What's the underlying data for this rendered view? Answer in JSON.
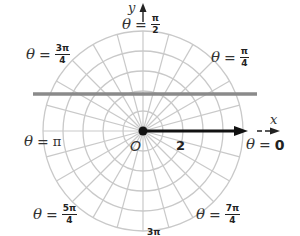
{
  "diagram": {
    "type": "polar-grid",
    "center": {
      "x": 143,
      "y": 131
    },
    "rings": {
      "count": 5,
      "spacing_px": 20
    },
    "ray_step_degrees": 15,
    "colors": {
      "grid": "#c9c9c9",
      "horizontal_line": "#8a8a8a",
      "vector": "#111111",
      "text": "#333333"
    },
    "axes": {
      "x_label": "x",
      "y_label": "y"
    },
    "origin_label": "O",
    "vector": {
      "length_label": "2",
      "direction": "θ = 0"
    },
    "horizontal_line": {
      "x1": 33,
      "x2": 257,
      "y": 94
    },
    "angle_labels": [
      {
        "id": "theta-0",
        "theta": "θ",
        "eq": "=",
        "value": "0"
      },
      {
        "id": "theta-pi-4",
        "theta": "θ",
        "eq": "=",
        "num": "π",
        "den": "4"
      },
      {
        "id": "theta-pi-2",
        "theta": "θ",
        "eq": "=",
        "num": "π",
        "den": "2"
      },
      {
        "id": "theta-3pi-4",
        "theta": "θ",
        "eq": "=",
        "num": "3π",
        "den": "4"
      },
      {
        "id": "theta-pi",
        "theta": "θ",
        "eq": "=",
        "value": "π"
      },
      {
        "id": "theta-5pi-4",
        "theta": "θ",
        "eq": "=",
        "num": "5π",
        "den": "4"
      },
      {
        "id": "theta-3pi-2-partial",
        "num": "3π"
      },
      {
        "id": "theta-7pi-4",
        "theta": "θ",
        "eq": "=",
        "num": "7π",
        "den": "4"
      }
    ]
  }
}
